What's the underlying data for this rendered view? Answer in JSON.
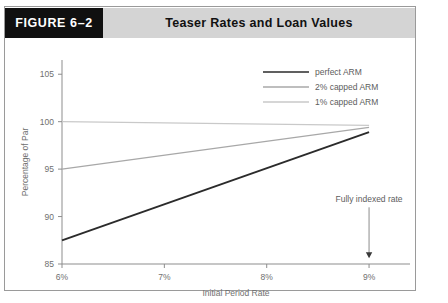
{
  "figure": {
    "tag": "FIGURE 6–2",
    "title": "Teaser Rates and Loan Values"
  },
  "chart_data": {
    "type": "line",
    "title": "Teaser Rates and Loan Values",
    "xlabel": "Initial Period Rate",
    "ylabel": "Percentage of Par",
    "xlim": [
      6,
      9.4
    ],
    "ylim": [
      85,
      106.5
    ],
    "xticks": [
      6,
      7,
      8,
      9
    ],
    "xticklabels": [
      "6%",
      "7%",
      "8%",
      "9%"
    ],
    "yticks": [
      85,
      90,
      95,
      100,
      105
    ],
    "yticklabels": [
      "85",
      "90",
      "95",
      "100",
      "105"
    ],
    "grid": false,
    "legend_position": "top-right",
    "series": [
      {
        "name": "perfect ARM",
        "color": "#2b2b2b",
        "width": 1.9,
        "x": [
          6,
          9
        ],
        "values": [
          87.5,
          98.9
        ]
      },
      {
        "name": "2% capped ARM",
        "color": "#a8a8a8",
        "width": 1.3,
        "x": [
          6,
          9
        ],
        "values": [
          95.0,
          99.4
        ]
      },
      {
        "name": "1% capped ARM",
        "color": "#c9c9c9",
        "width": 1.3,
        "x": [
          6,
          9
        ],
        "values": [
          100.0,
          99.6
        ]
      }
    ],
    "annotations": [
      {
        "text": "Fully indexed rate",
        "x": 9,
        "y": 91.5,
        "arrow_to_y": 85.6
      }
    ]
  }
}
